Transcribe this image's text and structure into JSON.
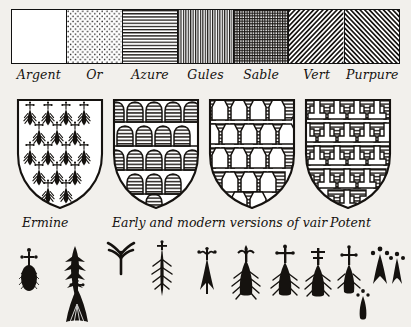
{
  "plate": {
    "title": "Heraldic tinctures and furs",
    "ink_color": "#15120f",
    "paper_color": "#f2f0ec"
  },
  "tinctures": {
    "items": [
      {
        "label": "Argent",
        "hatching": "plain",
        "meaning": "silver / white"
      },
      {
        "label": "Or",
        "hatching": "dotted",
        "meaning": "gold / yellow"
      },
      {
        "label": "Azure",
        "hatching": "horizontal",
        "meaning": "blue"
      },
      {
        "label": "Gules",
        "hatching": "vertical",
        "meaning": "red"
      },
      {
        "label": "Sable",
        "hatching": "crosshatch",
        "meaning": "black"
      },
      {
        "label": "Vert",
        "hatching": "diagonal-right",
        "meaning": "green"
      },
      {
        "label": "Purpure",
        "hatching": "diagonal-left",
        "meaning": "purple"
      }
    ]
  },
  "furs": {
    "shields": [
      {
        "name": "ermine",
        "pattern": "ermine-spots"
      },
      {
        "name": "vair-early",
        "pattern": "rounded-bells"
      },
      {
        "name": "vair-modern",
        "pattern": "angular-bells"
      },
      {
        "name": "potent",
        "pattern": "interlocking-t"
      }
    ],
    "captions": [
      {
        "text": "Ermine",
        "left": 22
      },
      {
        "text": "Early and modern versions of vair",
        "left": 112
      },
      {
        "text": "Potent",
        "left": 330
      }
    ]
  },
  "ermine_spots": {
    "caption": "Variant forms of the ermine spot",
    "specimens": [
      {
        "form": "oval-body-hatched-crosslet",
        "left": 14,
        "top": 8
      },
      {
        "form": "barbed-flame-leaf",
        "left": 62,
        "top": 6
      },
      {
        "form": "splayed-three-prong",
        "left": 104,
        "top": 4
      },
      {
        "form": "tapered-shaft-with-barbs",
        "left": 148,
        "top": 4
      },
      {
        "form": "fan-tail-with-crosslet",
        "left": 60,
        "top": 44
      },
      {
        "form": "plain-arrow-with-studs",
        "left": 192,
        "top": 10
      },
      {
        "form": "feathered-drop-fleur",
        "left": 228,
        "top": 8
      },
      {
        "form": "feathered-drop-crosslet",
        "left": 268,
        "top": 8
      },
      {
        "form": "double-cross-feathered-drop",
        "left": 302,
        "top": 10
      },
      {
        "form": "cross-topped-plume",
        "left": 334,
        "top": 6
      },
      {
        "form": "three-dot-spearhead",
        "left": 366,
        "top": 6
      },
      {
        "form": "small-three-dot-drop",
        "left": 386,
        "top": 12
      },
      {
        "form": "tiny-dotted-teardrop",
        "left": 352,
        "top": 48
      }
    ]
  }
}
